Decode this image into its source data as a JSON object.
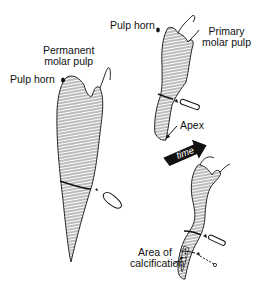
{
  "labels": {
    "permanent_title_line1": "Permanent",
    "permanent_title_line2": "molar pulp",
    "permanent_pulp_horn": "Pulp horn",
    "primary_pulp_horn": "Pulp horn",
    "primary_title_line1": "Primary",
    "primary_title_line2": "molar pulp",
    "apex": "Apex",
    "time_arrow": "time",
    "calcification_line1": "Area of",
    "calcification_line2": "calcification"
  },
  "colors": {
    "ink": "#111111",
    "hatch": "#555555",
    "background": "#ffffff"
  }
}
